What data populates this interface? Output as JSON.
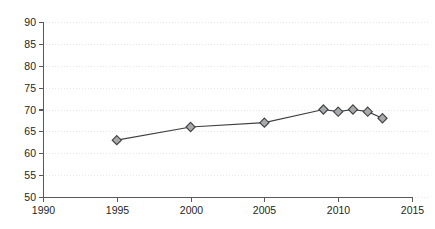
{
  "chart_data": {
    "type": "line",
    "title": "",
    "subtitle": "",
    "xlabel": "",
    "ylabel": "",
    "xlim": [
      1990,
      2015
    ],
    "ylim": [
      50,
      90
    ],
    "xticks": [
      1990,
      1995,
      2000,
      2005,
      2010,
      2015
    ],
    "yticks": [
      50,
      55,
      60,
      65,
      70,
      75,
      80,
      85,
      90
    ],
    "xtick_labels": [
      "1990",
      "1995",
      "2000",
      "2005",
      "2010",
      "2015"
    ],
    "ytick_labels": [
      "50",
      "55",
      "60",
      "65",
      "70",
      "75",
      "80",
      "85",
      "90"
    ],
    "grid": "horizontal-dotted",
    "legend": "none",
    "marker": "diamond",
    "marker_fill": "#a7a9ac",
    "marker_stroke": "#404040",
    "line_color": "#404040",
    "grid_color": "#e9e6ea",
    "axis_color": "#58595b",
    "background": "#ffffff",
    "x": [
      1995,
      2000,
      2005,
      2009,
      2010,
      2011,
      2012,
      2013
    ],
    "values": [
      63,
      66,
      67,
      70,
      69.5,
      70,
      69.5,
      68
    ],
    "series": [
      {
        "name": "series-1",
        "x": [
          1995,
          2000,
          2005,
          2009,
          2010,
          2011,
          2012,
          2013
        ],
        "values": [
          63,
          66,
          67,
          70,
          69.5,
          70,
          69.5,
          68
        ]
      }
    ]
  }
}
